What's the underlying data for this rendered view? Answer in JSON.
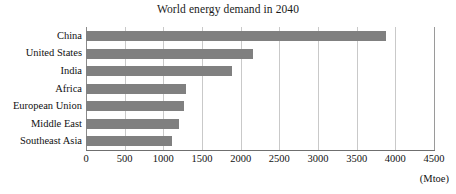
{
  "chart_data": {
    "type": "bar",
    "orientation": "horizontal",
    "title": "World energy demand in 2040",
    "xlabel": "",
    "ylabel": "",
    "unit_label": "(Mtoe)",
    "categories": [
      "China",
      "United States",
      "India",
      "Africa",
      "European Union",
      "Middle East",
      "Southeast Asia"
    ],
    "values": [
      3885,
      2160,
      1885,
      1290,
      1265,
      1200,
      1110
    ],
    "xlim": [
      0,
      4500
    ],
    "xticks": [
      0,
      500,
      1000,
      1500,
      2000,
      2500,
      3000,
      3500,
      4000,
      4500
    ],
    "xtick_labels": [
      "0",
      "500",
      "1000",
      "1500",
      "2000",
      "2500",
      "3000",
      "3500",
      "4000",
      "4500"
    ],
    "grid": "vertical",
    "legend": "none",
    "bar_color": "#808080",
    "gridline_color": "#c9c9c9",
    "axis_color": "#6f6f6f"
  }
}
